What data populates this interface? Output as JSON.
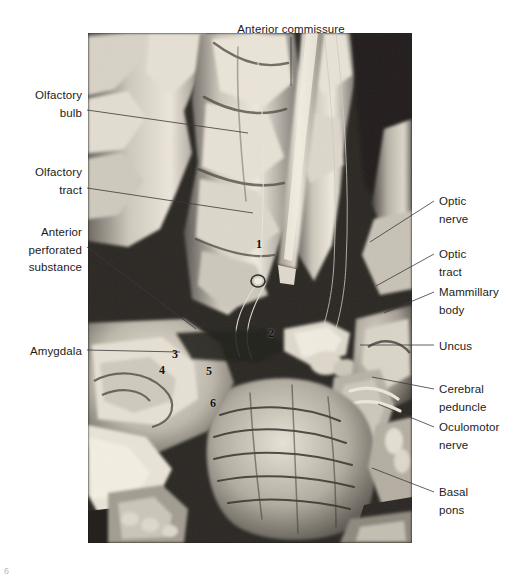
{
  "figure": {
    "page_number": "6",
    "photo": {
      "alt_name": "basal-forebrain-dissection-photograph"
    }
  },
  "labels": {
    "top": [
      {
        "id": "anterior-commissure",
        "text": "Anterior commissure"
      }
    ],
    "left": [
      {
        "id": "olfactory-bulb",
        "text": "Olfactory\nbulb"
      },
      {
        "id": "olfactory-tract",
        "text": "Olfactory\ntract"
      },
      {
        "id": "anterior-perforated-substance",
        "text": "Anterior\nperforated\nsubstance"
      },
      {
        "id": "amygdala",
        "text": "Amygdala"
      }
    ],
    "right": [
      {
        "id": "optic-nerve",
        "text": "Optic\nnerve"
      },
      {
        "id": "optic-tract",
        "text": "Optic\ntract"
      },
      {
        "id": "mammillary-body",
        "text": "Mammillary\nbody"
      },
      {
        "id": "uncus",
        "text": "Uncus"
      },
      {
        "id": "cerebral-peduncle",
        "text": "Cerebral\npeduncle"
      },
      {
        "id": "oculomotor-nerve",
        "text": "Oculomotor\nnerve"
      },
      {
        "id": "basal-pons",
        "text": "Basal\npons"
      }
    ]
  },
  "photo_markers": [
    {
      "id": "marker-1",
      "text": "1"
    },
    {
      "id": "marker-2",
      "text": "2"
    },
    {
      "id": "marker-3",
      "text": "3"
    },
    {
      "id": "marker-4",
      "text": "4"
    },
    {
      "id": "marker-5",
      "text": "5"
    },
    {
      "id": "marker-6",
      "text": "6"
    }
  ],
  "colors": {
    "text": "#1b1b1b",
    "leader_line": "#3a3a3a",
    "page_background": "#ffffff",
    "folio": "#b9b9b9"
  }
}
